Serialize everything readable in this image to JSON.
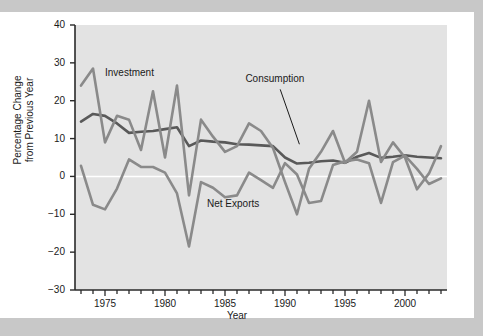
{
  "figure": {
    "background": "#ffffff",
    "plot_background": "#e3e3e3",
    "page_background": "#c8c8c8",
    "axis_color": "#2a2a2a",
    "zero_line_color": "#ffffff"
  },
  "chart_data": {
    "type": "line",
    "title": "",
    "xlabel": "Year",
    "ylabel": "Percentage Change from Previous Year",
    "ylabel_line1": "Percentage Change",
    "ylabel_line2": "from Previous Year",
    "xlim": [
      1972.5,
      2003.5
    ],
    "ylim": [
      -30,
      40
    ],
    "yticks": [
      40,
      30,
      20,
      10,
      0,
      -10,
      -20,
      -30
    ],
    "ytick_labels": [
      "40",
      "30",
      "20",
      "10",
      "0",
      "−10",
      "−20",
      "−30"
    ],
    "xticks": [
      1975,
      1980,
      1985,
      1990,
      1995,
      2000
    ],
    "xtick_labels": [
      "1975",
      "1980",
      "1985",
      "1990",
      "1995",
      "2000"
    ],
    "minor_xticks_every": 1,
    "x": [
      1973,
      1974,
      1975,
      1976,
      1977,
      1978,
      1979,
      1980,
      1981,
      1982,
      1983,
      1984,
      1985,
      1986,
      1987,
      1988,
      1989,
      1990,
      1991,
      1992,
      1993,
      1994,
      1995,
      1996,
      1997,
      1998,
      1999,
      2000,
      2001,
      2002,
      2003
    ],
    "grid": false,
    "legend": "inline-annotations",
    "series": [
      {
        "name": "Consumption",
        "color": "#595959",
        "width": 2.6,
        "label_position": {
          "x": 1989.2,
          "y": 25.5
        },
        "leader_line": {
          "from": [
            1989.6,
            23.0
          ],
          "to": [
            1991.2,
            8.5
          ]
        },
        "values": [
          14.5,
          16.5,
          16.0,
          14.0,
          11.5,
          11.8,
          12.0,
          12.5,
          13.0,
          8.0,
          9.5,
          9.2,
          9.0,
          8.5,
          8.4,
          8.2,
          8.0,
          5.0,
          3.4,
          3.6,
          4.0,
          4.2,
          3.6,
          5.2,
          6.2,
          4.9,
          5.2,
          5.6,
          5.2,
          5.0,
          4.8
        ]
      },
      {
        "name": "Investment",
        "color": "#8a8a8a",
        "width": 2.6,
        "label_position": {
          "x": 1975.0,
          "y": 27.0
        },
        "values": [
          24.0,
          28.5,
          9.0,
          16.0,
          15.0,
          7.0,
          22.5,
          5.0,
          24.0,
          -5.0,
          15.0,
          10.5,
          6.5,
          8.0,
          14.0,
          12.0,
          7.5,
          -1.5,
          -10.0,
          2.0,
          6.5,
          12.0,
          3.6,
          6.5,
          20.0,
          3.8,
          9.0,
          5.0,
          -3.4,
          0.8,
          8.0
        ]
      },
      {
        "name": "Net Exports",
        "color": "#8a8a8a",
        "width": 2.6,
        "label_position": {
          "x": 1986.0,
          "y": -7.5
        },
        "values": [
          2.8,
          -7.5,
          -8.7,
          -3.2,
          4.5,
          2.5,
          2.5,
          1.0,
          -4.5,
          -18.5,
          -1.5,
          -3.0,
          -5.5,
          -5.0,
          1.0,
          -1.0,
          -3.0,
          3.5,
          0.5,
          -7.0,
          -6.5,
          3.0,
          4.0,
          4.5,
          3.5,
          -7.0,
          3.8,
          5.5,
          2.0,
          -2.0,
          -0.5
        ]
      }
    ]
  },
  "annotations": {
    "investment_label": "Investment",
    "consumption_label": "Consumption",
    "net_exports_label": "Net Exports"
  }
}
